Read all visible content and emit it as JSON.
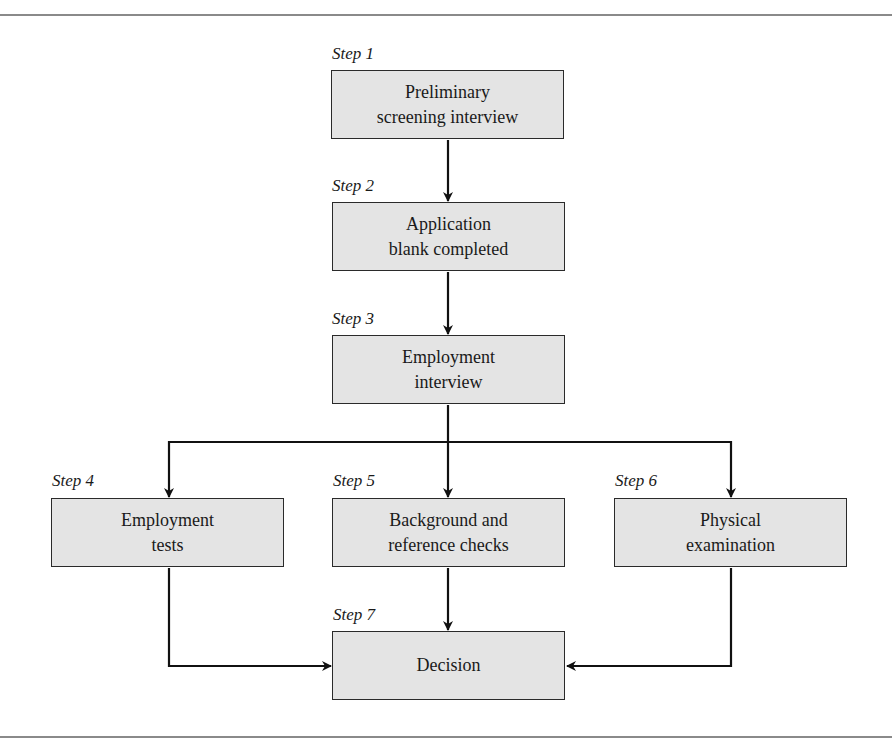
{
  "diagram": {
    "type": "flowchart",
    "colors": {
      "box_fill": "#e4e4e4",
      "box_border": "#2a2a2a",
      "arrow": "#111111",
      "rule": "#8a8a8a"
    },
    "steps": [
      {
        "id": 1,
        "step_label": "Step 1",
        "text": "Preliminary\nscreening interview"
      },
      {
        "id": 2,
        "step_label": "Step 2",
        "text": "Application\nblank completed"
      },
      {
        "id": 3,
        "step_label": "Step 3",
        "text": "Employment\ninterview"
      },
      {
        "id": 4,
        "step_label": "Step 4",
        "text": "Employment\ntests"
      },
      {
        "id": 5,
        "step_label": "Step 5",
        "text": "Background and\nreference checks"
      },
      {
        "id": 6,
        "step_label": "Step 6",
        "text": "Physical\nexamination"
      },
      {
        "id": 7,
        "step_label": "Step 7",
        "text": "Decision"
      }
    ],
    "edges": [
      {
        "from": 1,
        "to": 2
      },
      {
        "from": 2,
        "to": 3
      },
      {
        "from": 3,
        "to": 4
      },
      {
        "from": 3,
        "to": 5
      },
      {
        "from": 3,
        "to": 6
      },
      {
        "from": 4,
        "to": 7
      },
      {
        "from": 5,
        "to": 7
      },
      {
        "from": 6,
        "to": 7
      }
    ]
  }
}
